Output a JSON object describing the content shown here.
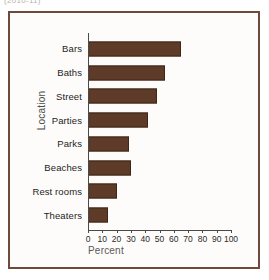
{
  "top_caption": "(2010-11)",
  "chart_data": {
    "type": "bar",
    "orientation": "horizontal",
    "title": "",
    "xlabel": "Percent",
    "ylabel": "Location",
    "xlim": [
      0,
      100
    ],
    "xticks": [
      0,
      10,
      20,
      30,
      40,
      50,
      60,
      70,
      80,
      90,
      100
    ],
    "grid": false,
    "legend": false,
    "bar_color": "#5E3A28",
    "bar_edge_color": "#3F2617",
    "frame_color": "#6D4A3A",
    "categories": [
      "Bars",
      "Baths",
      "Street",
      "Parties",
      "Parks",
      "Beaches",
      "Rest rooms",
      "Theaters"
    ],
    "values": [
      65,
      54,
      48,
      42,
      29,
      30,
      20,
      14
    ],
    "series": [
      {
        "name": "Percent",
        "values": [
          65,
          54,
          48,
          42,
          29,
          30,
          20,
          14
        ]
      }
    ],
    "points": [
      {
        "category": "Bars",
        "value": 65
      },
      {
        "category": "Baths",
        "value": 54
      },
      {
        "category": "Street",
        "value": 48
      },
      {
        "category": "Parties",
        "value": 42
      },
      {
        "category": "Parks",
        "value": 29
      },
      {
        "category": "Beaches",
        "value": 30
      },
      {
        "category": "Rest rooms",
        "value": 20
      },
      {
        "category": "Theaters",
        "value": 14
      }
    ]
  }
}
